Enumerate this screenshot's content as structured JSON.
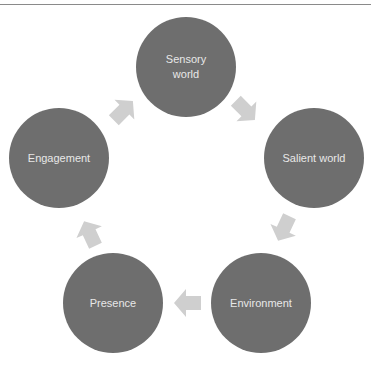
{
  "diagram": {
    "type": "cycle",
    "colors": {
      "node_fill": "#6e6e6e",
      "node_text": "#e8e8e8",
      "arrow_fill": "#cfcfcf",
      "rule": "#8a8a8a"
    },
    "nodes": [
      {
        "id": "sensory",
        "label_line1": "Sensory",
        "label_line2": "world",
        "cx": 186,
        "cy": 67
      },
      {
        "id": "salient",
        "label_line1": "Salient world",
        "label_line2": "",
        "cx": 314,
        "cy": 158
      },
      {
        "id": "environment",
        "label_line1": "Environment",
        "label_line2": "",
        "cx": 261,
        "cy": 303
      },
      {
        "id": "presence",
        "label_line1": "Presence",
        "label_line2": "",
        "cx": 113,
        "cy": 303
      },
      {
        "id": "engagement",
        "label_line1": "Engagement",
        "label_line2": "",
        "cx": 59,
        "cy": 158
      }
    ],
    "edges": [
      {
        "from": "sensory",
        "to": "salient",
        "arrow_center": [
          245,
          110
        ],
        "angle_deg": 45
      },
      {
        "from": "salient",
        "to": "environment",
        "arrow_center": [
          284,
          228
        ],
        "angle_deg": 115
      },
      {
        "from": "environment",
        "to": "presence",
        "arrow_center": [
          188,
          303
        ],
        "angle_deg": 180
      },
      {
        "from": "presence",
        "to": "engagement",
        "arrow_center": [
          90,
          234
        ],
        "angle_deg": 245
      },
      {
        "from": "engagement",
        "to": "sensory",
        "arrow_center": [
          123,
          111
        ],
        "angle_deg": 315
      }
    ]
  }
}
